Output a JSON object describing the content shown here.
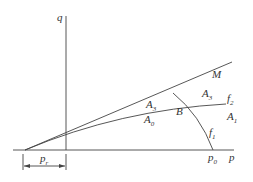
{
  "diagram": {
    "axes": {
      "vertical_label": "q",
      "horizontal_label": "p"
    },
    "curves": {
      "line_M": "M",
      "line_f2": {
        "base": "f",
        "sub": "2"
      },
      "curve_f1": {
        "base": "f",
        "sub": "1"
      }
    },
    "regions": {
      "A3_upper": {
        "base": "A",
        "sub": "3"
      },
      "A3_right": {
        "base": "A",
        "sub": "3"
      },
      "A0": {
        "base": "A",
        "sub": "0"
      },
      "A1": {
        "base": "A",
        "sub": "1"
      }
    },
    "points": {
      "B": "B",
      "p0": {
        "base": "p",
        "sub": "0"
      }
    },
    "dimension": {
      "base": "p",
      "sub": "r"
    }
  }
}
